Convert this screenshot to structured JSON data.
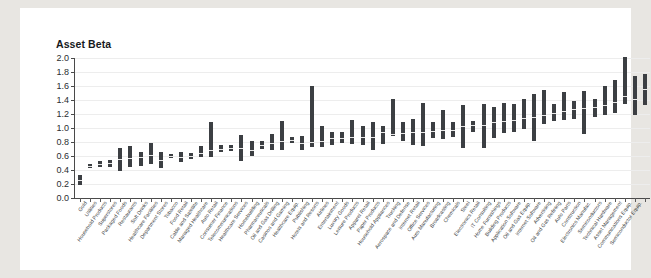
{
  "page": {
    "background_color": "#e8e6e2",
    "paper_color": "#ffffff",
    "bar_color": "#3c3f43",
    "median_color": "#e9e9e9",
    "grid_color": "#ededed",
    "axis_color": "#4a4a4a"
  },
  "ghost_text": {
    "line1": "a ghosted line of reversed print showing through the page from the other side",
    "line2": "faint show-through of text and figures"
  },
  "chart_data": {
    "type": "bar",
    "title": "Asset Beta",
    "subtitle": "",
    "xlabel": "",
    "ylabel": "Asset Beta",
    "ylim": [
      0.0,
      2.0
    ],
    "ytick_labels": [
      "0.0",
      "0.2",
      "0.4",
      "0.6",
      "0.8",
      "1.0",
      "1.2",
      "1.4",
      "1.6",
      "1.8",
      "2.0"
    ],
    "ytick_values": [
      0.0,
      0.2,
      0.4,
      0.6,
      0.8,
      1.0,
      1.2,
      1.4,
      1.6,
      1.8,
      2.0
    ],
    "grid": true,
    "legend": "none",
    "value_encoding": "floating range bar: low to high asset beta with light median tick",
    "series": [
      {
        "name": "low",
        "description": "bottom of each range bar"
      },
      {
        "name": "median",
        "description": "light tick inside each bar"
      },
      {
        "name": "high",
        "description": "top of each range bar"
      }
    ],
    "categories": [
      "Gold",
      "Utilities",
      "Household Products",
      "Superstores",
      "Packaged Foods",
      "Restaurants",
      "Soft Drinks",
      "Healthcare Facilities",
      "Department Stores",
      "Tobacco",
      "Food Retail",
      "Cable and Satellite",
      "Managed Healthcare",
      "Auto Retail",
      "Consumer Finance",
      "Telecommunications",
      "Healthcare Services",
      "Homebuilding",
      "Pharmaceuticals",
      "Oil and Gas Drilling",
      "Casinos and Gaming",
      "Healthcare Equip.",
      "Publishing",
      "Hotels and Resorts",
      "Airlines",
      "Entertainment",
      "Luxury Goods",
      "Leisure Products",
      "Apparel Retail",
      "Paper Products",
      "Household Appliances",
      "Trucking",
      "Aerospace and Defense",
      "Internet Retail",
      "Office Services",
      "Auto Manufacturing",
      "Broadcasting",
      "Chemicals",
      "Steel",
      "Electronics Retail",
      "IT Consulting",
      "Home Furnishings",
      "Building Products",
      "Application Software",
      "Oil and Gas Equip.",
      "Internet Software",
      "Advertising",
      "Oil and Gas Refining",
      "Auto Parts",
      "Construction",
      "Electronics Manufac.",
      "Semiconductors",
      "Technical Hardware",
      "Asset Management",
      "Communications Equip.",
      "Semiconductor Equip."
    ],
    "bars": [
      {
        "category": "Gold",
        "low": 0.19,
        "median": 0.26,
        "high": 0.33
      },
      {
        "category": "Utilities",
        "low": 0.43,
        "median": 0.46,
        "high": 0.49
      },
      {
        "category": "Household Products",
        "low": 0.44,
        "median": 0.48,
        "high": 0.53
      },
      {
        "category": "Superstores",
        "low": 0.44,
        "median": 0.5,
        "high": 0.55
      },
      {
        "category": "Packaged Foods",
        "low": 0.39,
        "median": 0.55,
        "high": 0.72
      },
      {
        "category": "Restaurants",
        "low": 0.44,
        "median": 0.57,
        "high": 0.75
      },
      {
        "category": "Soft Drinks",
        "low": 0.46,
        "median": 0.58,
        "high": 0.66
      },
      {
        "category": "Healthcare Facilities",
        "low": 0.49,
        "median": 0.62,
        "high": 0.78
      },
      {
        "category": "Department Stores",
        "low": 0.43,
        "median": 0.54,
        "high": 0.66
      },
      {
        "category": "Tobacco",
        "low": 0.57,
        "median": 0.6,
        "high": 0.63
      },
      {
        "category": "Food Retail",
        "low": 0.52,
        "median": 0.58,
        "high": 0.66
      },
      {
        "category": "Cable and Satellite",
        "low": 0.56,
        "median": 0.6,
        "high": 0.64
      },
      {
        "category": "Managed Healthcare",
        "low": 0.58,
        "median": 0.65,
        "high": 0.75
      },
      {
        "category": "Auto Retail",
        "low": 0.58,
        "median": 0.68,
        "high": 1.08
      },
      {
        "category": "Consumer Finance",
        "low": 0.66,
        "median": 0.7,
        "high": 0.76
      },
      {
        "category": "Telecommunications",
        "low": 0.67,
        "median": 0.71,
        "high": 0.76
      },
      {
        "category": "Healthcare Services",
        "low": 0.53,
        "median": 0.72,
        "high": 0.9
      },
      {
        "category": "Homebuilding",
        "low": 0.6,
        "median": 0.69,
        "high": 0.82
      },
      {
        "category": "Pharmaceuticals",
        "low": 0.7,
        "median": 0.76,
        "high": 0.81
      },
      {
        "category": "Oil and Gas Drilling",
        "low": 0.68,
        "median": 0.79,
        "high": 0.91
      },
      {
        "category": "Casinos and Gaming",
        "low": 0.69,
        "median": 0.81,
        "high": 1.1
      },
      {
        "category": "Healthcare Equip.",
        "low": 0.79,
        "median": 0.83,
        "high": 0.87
      },
      {
        "category": "Publishing",
        "low": 0.68,
        "median": 0.78,
        "high": 0.89
      },
      {
        "category": "Hotels and Resorts",
        "low": 0.73,
        "median": 0.8,
        "high": 1.6
      },
      {
        "category": "Airlines",
        "low": 0.73,
        "median": 0.82,
        "high": 1.03
      },
      {
        "category": "Entertainment",
        "low": 0.76,
        "median": 0.86,
        "high": 0.95
      },
      {
        "category": "Luxury Goods",
        "low": 0.78,
        "median": 0.86,
        "high": 0.95
      },
      {
        "category": "Leisure Products",
        "low": 0.77,
        "median": 0.87,
        "high": 1.12
      },
      {
        "category": "Apparel Retail",
        "low": 0.76,
        "median": 0.87,
        "high": 1.03
      },
      {
        "category": "Paper Products",
        "low": 0.69,
        "median": 0.87,
        "high": 1.08
      },
      {
        "category": "Household Appliances",
        "low": 0.77,
        "median": 0.94,
        "high": 1.03
      },
      {
        "category": "Trucking",
        "low": 0.88,
        "median": 0.91,
        "high": 1.41
      },
      {
        "category": "Aerospace and Defense",
        "low": 0.82,
        "median": 0.93,
        "high": 1.09
      },
      {
        "category": "Internet Retail",
        "low": 0.75,
        "median": 0.94,
        "high": 1.13
      },
      {
        "category": "Office Services",
        "low": 0.74,
        "median": 0.94,
        "high": 1.36
      },
      {
        "category": "Auto Manufacturing",
        "low": 0.85,
        "median": 0.95,
        "high": 1.08
      },
      {
        "category": "Broadcasting",
        "low": 0.84,
        "median": 0.97,
        "high": 1.26
      },
      {
        "category": "Chemicals",
        "low": 0.87,
        "median": 0.97,
        "high": 1.09
      },
      {
        "category": "Steel",
        "low": 0.72,
        "median": 1.03,
        "high": 1.33
      },
      {
        "category": "Electronics Retail",
        "low": 0.95,
        "median": 1.04,
        "high": 1.1
      },
      {
        "category": "IT Consulting",
        "low": 0.71,
        "median": 1.05,
        "high": 1.35
      },
      {
        "category": "Home Furnishings",
        "low": 0.86,
        "median": 1.08,
        "high": 1.3
      },
      {
        "category": "Building Products",
        "low": 0.93,
        "median": 1.1,
        "high": 1.36
      },
      {
        "category": "Application Software",
        "low": 0.95,
        "median": 1.12,
        "high": 1.35
      },
      {
        "category": "Oil and Gas Equip.",
        "low": 0.99,
        "median": 1.14,
        "high": 1.42
      },
      {
        "category": "Internet Software",
        "low": 0.81,
        "median": 1.15,
        "high": 1.49
      },
      {
        "category": "Advertising",
        "low": 1.06,
        "median": 1.19,
        "high": 1.55
      },
      {
        "category": "Oil and Gas Refining",
        "low": 1.1,
        "median": 1.22,
        "high": 1.34
      },
      {
        "category": "Auto Parts",
        "low": 1.11,
        "median": 1.24,
        "high": 1.51
      },
      {
        "category": "Construction",
        "low": 1.13,
        "median": 1.27,
        "high": 1.38
      },
      {
        "category": "Electronics Manufac.",
        "low": 0.92,
        "median": 1.28,
        "high": 1.53
      },
      {
        "category": "Semiconductors",
        "low": 1.16,
        "median": 1.3,
        "high": 1.41
      },
      {
        "category": "Technical Hardware",
        "low": 1.19,
        "median": 1.33,
        "high": 1.6
      },
      {
        "category": "Asset Management",
        "low": 1.21,
        "median": 1.37,
        "high": 1.68
      },
      {
        "category": "Communications Equip.",
        "low": 1.34,
        "median": 1.46,
        "high": 2.01
      },
      {
        "category": "Semiconductor Equip.",
        "low": 1.18,
        "median": 1.42,
        "high": 1.74
      },
      {
        "category": "Semiconductor Equip. 2",
        "low": 1.33,
        "median": 1.55,
        "high": 1.77
      }
    ]
  }
}
